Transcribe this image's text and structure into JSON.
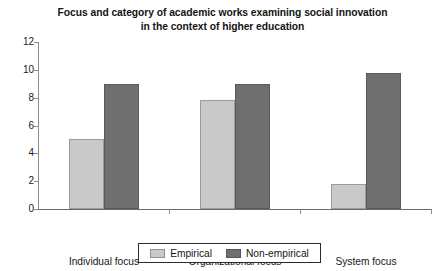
{
  "chart_data": {
    "type": "bar",
    "title": "Focus and category of academic works examining social innovation in the context of higher education",
    "title_lines": [
      "Focus and category of academic works examining social innovation",
      "in the context of higher education"
    ],
    "xlabel": "",
    "ylabel": "",
    "categories": [
      "Individual focus",
      "Organizational focus",
      "System focus"
    ],
    "series": [
      {
        "name": "Empirical",
        "color": "#c9c9c9",
        "values": [
          5.0,
          7.8,
          1.8
        ]
      },
      {
        "name": "Non-empirical",
        "color": "#6f6f6f",
        "values": [
          9.0,
          9.0,
          9.8
        ]
      }
    ],
    "ylim": [
      0,
      12
    ],
    "ytick_values": [
      12,
      10,
      8,
      6,
      4,
      2,
      0
    ],
    "ytick_labels": [
      "12",
      "10",
      "8",
      "6",
      "4",
      "2",
      "0"
    ],
    "grid": false,
    "legend_position": "bottom-center",
    "legend_entries": [
      "Empirical",
      "Non-empirical"
    ]
  },
  "colors": {
    "background": "#ffffff",
    "axis": "#8d8d8d",
    "baseline": "#6b6b6b",
    "text": "#1b1b1b",
    "empirical": "#c9c9c9",
    "empirical_border": "#9b9b9b",
    "nonempirical": "#6f6f6f",
    "nonempirical_border": "#5a5a5a",
    "legend_border": "#2b2b2b"
  }
}
